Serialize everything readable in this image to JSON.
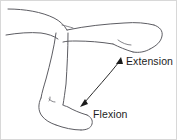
{
  "figure": {
    "background_color": "#ffffff",
    "line_color": "#5d5d63",
    "arrow_color": "#1c1c1c",
    "text_color": "#1d1d1d",
    "border_color": "#d8d8d8"
  },
  "labels": {
    "extension": "Extension",
    "flexion": "Flexion"
  },
  "arrow": {
    "name": "double-headed-curved-arrow",
    "head_top_label": "Extension",
    "head_bottom_label": "Flexion"
  },
  "anatomy": {
    "upper_leg": "thigh-and-extended-foot",
    "lower_leg": "shin-and-flexed-foot"
  }
}
